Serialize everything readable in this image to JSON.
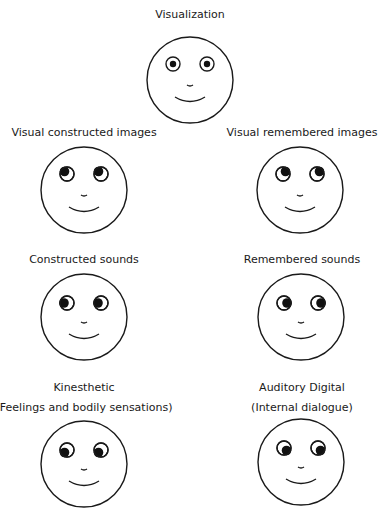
{
  "diagram": {
    "stroke_color": "#1a1a1a",
    "pupil_color": "#111111",
    "faces": [
      {
        "id": "visualization",
        "label": "Visualization",
        "sublabel": "",
        "label_x": 190,
        "label_y": 8,
        "cx": 190,
        "cy": 80,
        "eye_y": 64,
        "pupil": "center"
      },
      {
        "id": "visual-constructed",
        "label": "Visual constructed images",
        "sublabel": "",
        "label_x": 84,
        "label_y": 126,
        "cx": 84,
        "cy": 190,
        "eye_y": 174,
        "pupil": "up-left"
      },
      {
        "id": "visual-remembered",
        "label": "Visual remembered images",
        "sublabel": "",
        "label_x": 302,
        "label_y": 126,
        "cx": 300,
        "cy": 190,
        "eye_y": 174,
        "pupil": "up-right"
      },
      {
        "id": "constructed-sounds",
        "label": "Constructed sounds",
        "sublabel": "",
        "label_x": 84,
        "label_y": 253,
        "cx": 84,
        "cy": 317,
        "eye_y": 303,
        "pupil": "left"
      },
      {
        "id": "remembered-sounds",
        "label": "Remembered sounds",
        "sublabel": "",
        "label_x": 302,
        "label_y": 253,
        "cx": 301,
        "cy": 317,
        "eye_y": 303,
        "pupil": "right"
      },
      {
        "id": "kinesthetic",
        "label": "Kinesthetic",
        "sublabel": "(Feelings and bodily sensations)",
        "label_x": 84,
        "label_y": 381,
        "cx": 84,
        "cy": 464,
        "eye_y": 450,
        "pupil": "down-left"
      },
      {
        "id": "auditory-digital",
        "label": "Auditory Digital",
        "sublabel": "(Internal dialogue)",
        "label_x": 302,
        "label_y": 381,
        "cx": 301,
        "cy": 462,
        "eye_y": 448,
        "pupil": "down-right"
      }
    ]
  }
}
